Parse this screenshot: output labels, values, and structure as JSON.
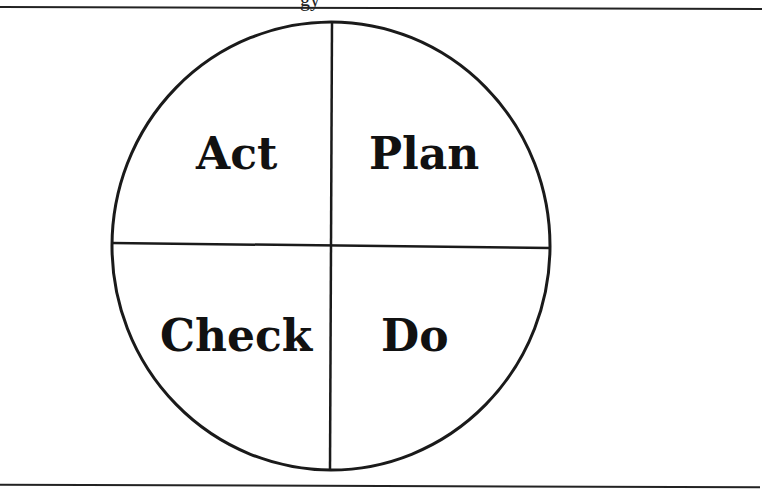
{
  "diagram": {
    "title_fragment": "gy",
    "quadrants": {
      "top_left": "Act",
      "top_right": "Plan",
      "bottom_left": "Check",
      "bottom_right": "Do"
    },
    "colors": {
      "stroke": "#1a1a1a",
      "background": "#ffffff",
      "text": "#111111"
    }
  }
}
